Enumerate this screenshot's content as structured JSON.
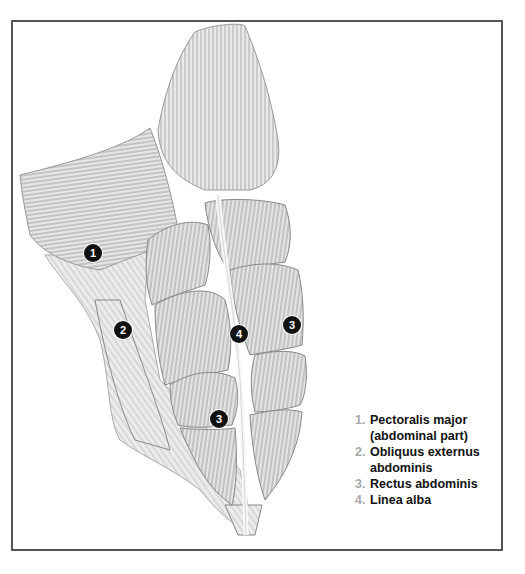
{
  "figure": {
    "frame_color": "#555555",
    "marker_color": "#111111",
    "legend_number_color": "#a8a8a8"
  },
  "markers": [
    {
      "label": "1",
      "x": 93,
      "y": 253
    },
    {
      "label": "2",
      "x": 123,
      "y": 330
    },
    {
      "label": "3",
      "x": 292,
      "y": 325
    },
    {
      "label": "4",
      "x": 239,
      "y": 334
    },
    {
      "label": "3",
      "x": 219,
      "y": 419
    }
  ],
  "legend": [
    {
      "num": "1.",
      "text": "Pectoralis major\n(abdominal part)"
    },
    {
      "num": "2.",
      "text": "Obliquus externus\nabdominis"
    },
    {
      "num": "3.",
      "text": "Rectus abdominis"
    },
    {
      "num": "4.",
      "text": "Linea alba"
    }
  ]
}
